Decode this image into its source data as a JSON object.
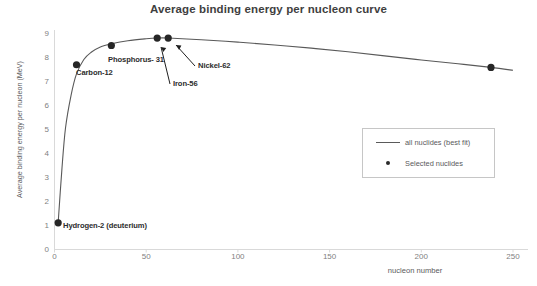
{
  "chart_data": {
    "type": "scatter",
    "title": "Average binding energy per nucleon curve",
    "xlabel": "nucleon number",
    "ylabel": "Average binding energy per nucleon (MeV)",
    "xlim": [
      0,
      250
    ],
    "ylim": [
      0,
      9
    ],
    "xticks": [
      "0",
      "50",
      "100",
      "150",
      "200",
      "250"
    ],
    "yticks": [
      "0",
      "1",
      "2",
      "3",
      "4",
      "5",
      "6",
      "7",
      "8",
      "9"
    ],
    "grid": false,
    "legend_position": "inside-right",
    "legend": [
      {
        "label": "all nuclides (best fit)",
        "marker": "line"
      },
      {
        "label": "Selected nuclides",
        "marker": "dot"
      }
    ],
    "points": [
      {
        "label": "Hydrogen-2 (deuterium)",
        "x": 2,
        "y": 1.11
      },
      {
        "label": "Carbon-12",
        "x": 12,
        "y": 7.68
      },
      {
        "label": "Phosphorus- 31",
        "x": 31,
        "y": 8.48
      },
      {
        "label": "Iron-56",
        "x": 56,
        "y": 8.79
      },
      {
        "label": "Nickel-62",
        "x": 62,
        "y": 8.79
      },
      {
        "label": "Uranium-238",
        "x": 238,
        "y": 7.57
      }
    ],
    "curve": [
      {
        "x": 2,
        "y": 1.11
      },
      {
        "x": 4,
        "y": 3.3
      },
      {
        "x": 6,
        "y": 5.05
      },
      {
        "x": 9,
        "y": 6.4
      },
      {
        "x": 12,
        "y": 7.3
      },
      {
        "x": 16,
        "y": 7.9
      },
      {
        "x": 20,
        "y": 8.2
      },
      {
        "x": 25,
        "y": 8.42
      },
      {
        "x": 31,
        "y": 8.55
      },
      {
        "x": 40,
        "y": 8.68
      },
      {
        "x": 50,
        "y": 8.76
      },
      {
        "x": 56,
        "y": 8.79
      },
      {
        "x": 62,
        "y": 8.79
      },
      {
        "x": 80,
        "y": 8.72
      },
      {
        "x": 100,
        "y": 8.62
      },
      {
        "x": 120,
        "y": 8.5
      },
      {
        "x": 140,
        "y": 8.37
      },
      {
        "x": 160,
        "y": 8.22
      },
      {
        "x": 180,
        "y": 8.05
      },
      {
        "x": 200,
        "y": 7.88
      },
      {
        "x": 220,
        "y": 7.72
      },
      {
        "x": 238,
        "y": 7.57
      },
      {
        "x": 250,
        "y": 7.45
      }
    ],
    "annotations": [
      {
        "label": "Hydrogen-2 (deuterium)",
        "leader": false
      },
      {
        "label": "Carbon-12",
        "leader": false
      },
      {
        "label": "Phosphorus- 31",
        "leader": false
      },
      {
        "label": "Iron-56",
        "leader": true
      },
      {
        "label": "Nickel-62",
        "leader": true
      }
    ],
    "colors": {
      "curve": "#595959",
      "marker": "#262626",
      "axis": "#d9d9d9",
      "tick_text": "#7f7f7f",
      "title_text": "#3f3f3f"
    }
  }
}
